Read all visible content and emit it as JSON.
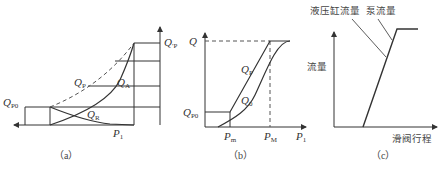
{
  "panels": {
    "a": {
      "caption": "（a）",
      "labels": {
        "qp_prime_main": "Q",
        "qp_prime_sub": "′P",
        "qp_main": "Q",
        "qp_sub": "P",
        "qa_main": "Q",
        "qa_sub": "A",
        "qr_main": "Q",
        "qr_sub": "R",
        "qp0_main": "Q",
        "qp0_sub": "P0",
        "p1_main": "P",
        "p1_sub": "1"
      }
    },
    "b": {
      "caption": "（b）",
      "labels": {
        "q": "Q",
        "qp_main": "Q",
        "qp_sub": "P",
        "q0_main": "Q",
        "q0_sub": "0",
        "qp0_main": "Q",
        "qp0_sub": "P0",
        "pm_main": "P",
        "pm_sub": "m",
        "pM_main": "P",
        "pM_sub": "M",
        "p1_main": "P",
        "p1_sub": "1"
      }
    },
    "c": {
      "caption": "（c）",
      "labels": {
        "cylinder_flow": "液压缸流量",
        "pump_flow": "泵流量",
        "y_axis": "流量",
        "x_axis": "滑阀行程"
      }
    }
  },
  "colors": {
    "line": "#333333",
    "dashed": "#555555"
  }
}
